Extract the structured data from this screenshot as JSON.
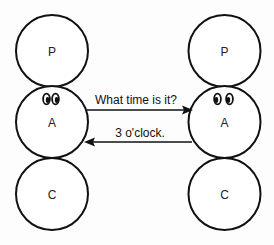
{
  "diagram": {
    "colors": {
      "stroke": "#111111",
      "background": "#fdfdfd",
      "fill": "#ffffff"
    },
    "left_person": {
      "states": [
        {
          "label": "P",
          "cx": 52,
          "cy": 51,
          "r": 36
        },
        {
          "label": "A",
          "cx": 52,
          "cy": 122,
          "r": 36
        },
        {
          "label": "C",
          "cx": 52,
          "cy": 194,
          "r": 36
        }
      ],
      "eyes_on": "A",
      "gaze": "right"
    },
    "right_person": {
      "states": [
        {
          "label": "P",
          "cx": 224,
          "cy": 51,
          "r": 36
        },
        {
          "label": "A",
          "cx": 224,
          "cy": 122,
          "r": 36
        },
        {
          "label": "C",
          "cx": 224,
          "cy": 194,
          "r": 36
        }
      ],
      "eyes_on": "A",
      "gaze": "left"
    },
    "messages": [
      {
        "text": "What time is it?",
        "from": "left A",
        "to": "right A",
        "direction": "right"
      },
      {
        "text": "3 o'clock.",
        "from": "right A",
        "to": "left A",
        "direction": "left"
      }
    ]
  }
}
